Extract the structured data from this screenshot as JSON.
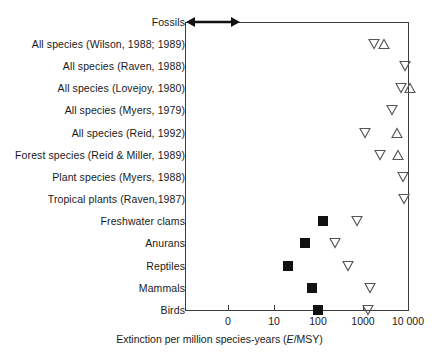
{
  "chart_data": {
    "type": "scatter",
    "title": "",
    "xlabel": "Extinction per million species-years (E/MSY)",
    "ylabel": "",
    "xscale": "log-like-categorical",
    "xticks": [
      {
        "label": "0",
        "px": 228
      },
      {
        "label": "10",
        "px": 274
      },
      {
        "label": "100",
        "px": 318
      },
      {
        "label": "1000",
        "px": 363
      },
      {
        "label": "10 000",
        "px": 408
      }
    ],
    "grid": false,
    "legend": null,
    "marker_kinds": {
      "square": "filled black square — observed / recorded extinction rate",
      "down_triangle": "open down-pointing triangle — estimate (low/other bound)",
      "up_triangle": "open up-pointing triangle — estimate (high bound)",
      "range_arrow": "double-headed arrow — background fossil record range"
    },
    "categories": [
      {
        "label": "Fossils",
        "y": 22,
        "range_arrow": {
          "x_start_px": 186,
          "x_end_px": 238
        },
        "markers": []
      },
      {
        "label": "All species (Wilson, 1988; 1989)",
        "y": 44,
        "markers": [
          {
            "kind": "down_triangle",
            "px": 374
          },
          {
            "kind": "up_triangle",
            "px": 384
          }
        ]
      },
      {
        "label": "All species (Raven, 1988)",
        "y": 66,
        "markers": [
          {
            "kind": "down_triangle",
            "px": 405
          }
        ]
      },
      {
        "label": "All species (Lovejoy, 1980)",
        "y": 88,
        "markers": [
          {
            "kind": "down_triangle",
            "px": 401
          },
          {
            "kind": "up_triangle",
            "px": 410
          }
        ]
      },
      {
        "label": "All species (Myers, 1979)",
        "y": 110,
        "markers": [
          {
            "kind": "down_triangle",
            "px": 392
          }
        ]
      },
      {
        "label": "All species (Reid, 1992)",
        "y": 133,
        "markers": [
          {
            "kind": "down_triangle",
            "px": 365
          },
          {
            "kind": "up_triangle",
            "px": 397
          }
        ]
      },
      {
        "label": "Forest species (Reid & Miller, 1989)",
        "y": 155,
        "markers": [
          {
            "kind": "down_triangle",
            "px": 380
          },
          {
            "kind": "up_triangle",
            "px": 398
          }
        ]
      },
      {
        "label": "Plant species (Myers, 1988)",
        "y": 177,
        "markers": [
          {
            "kind": "down_triangle",
            "px": 403
          }
        ]
      },
      {
        "label": "Tropical plants (Raven,1987)",
        "y": 199,
        "markers": [
          {
            "kind": "down_triangle",
            "px": 404
          }
        ]
      },
      {
        "label": "Freshwater clams",
        "y": 221,
        "markers": [
          {
            "kind": "square",
            "px": 323
          },
          {
            "kind": "down_triangle",
            "px": 357
          }
        ]
      },
      {
        "label": "Anurans",
        "y": 243,
        "markers": [
          {
            "kind": "square",
            "px": 305
          },
          {
            "kind": "down_triangle",
            "px": 335
          }
        ]
      },
      {
        "label": "Reptiles",
        "y": 266,
        "markers": [
          {
            "kind": "square",
            "px": 288
          },
          {
            "kind": "down_triangle",
            "px": 348
          }
        ]
      },
      {
        "label": "Mammals",
        "y": 288,
        "markers": [
          {
            "kind": "square",
            "px": 312
          },
          {
            "kind": "down_triangle",
            "px": 370
          }
        ]
      },
      {
        "label": "Birds",
        "y": 310,
        "markers": [
          {
            "kind": "square",
            "px": 318
          },
          {
            "kind": "down_triangle",
            "px": 368
          }
        ]
      }
    ]
  },
  "axis": {
    "title_prefix": "Extinction per million species-years (",
    "title_italic": "E",
    "title_suffix": "/MSY)"
  },
  "colors": {
    "line": "#3c3c3c",
    "text": "#1a1a1a",
    "marker_fill": "#111111",
    "marker_stroke": "#555555",
    "background": "#ffffff"
  }
}
